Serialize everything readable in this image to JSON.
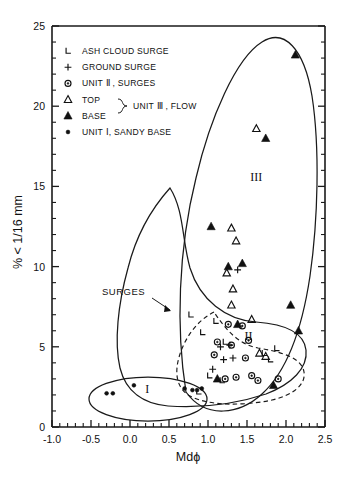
{
  "figure": {
    "background": "#ffffff",
    "ink": "#111111"
  },
  "chart_data": {
    "type": "scatter",
    "title": "",
    "xlabel": "Mdϕ",
    "ylabel": "% < 1/16 mm",
    "xlim": [
      -1.0,
      2.5
    ],
    "ylim": [
      0,
      25
    ],
    "xticks": [
      -1.0,
      -0.5,
      0.0,
      0.5,
      1.0,
      1.5,
      2.0,
      2.5
    ],
    "xticklabels": [
      "-1.0",
      "-0.5",
      "0.0",
      "0.5",
      "1.0",
      "1.5",
      "2.0",
      "2.5"
    ],
    "yticks": [
      0,
      5,
      10,
      15,
      20,
      25
    ],
    "yticklabels": [
      "0",
      "5",
      "10",
      "15",
      "20",
      "25"
    ],
    "x_minor_step": 0.1,
    "y_minor_step": 1,
    "grid": false,
    "legend_position": "upper-left-inside",
    "series": [
      {
        "name": "ASH CLOUD SURGE",
        "symbol": "ell-corner",
        "points": [
          [
            0.78,
            7.0
          ],
          [
            0.93,
            5.9
          ],
          [
            1.1,
            6.6
          ],
          [
            1.22,
            5.3
          ],
          [
            1.02,
            3.2
          ],
          [
            1.18,
            2.9
          ],
          [
            1.72,
            4.6
          ],
          [
            1.8,
            4.2
          ],
          [
            1.88,
            4.9
          ],
          [
            0.88,
            2.2
          ]
        ]
      },
      {
        "name": "GROUND SURGE",
        "symbol": "plus",
        "points": [
          [
            1.38,
            9.8
          ],
          [
            1.2,
            4.2
          ],
          [
            1.32,
            4.3
          ],
          [
            1.06,
            3.6
          ],
          [
            1.28,
            5.1
          ],
          [
            1.16,
            5.0
          ]
        ]
      },
      {
        "name": "UNIT II , SURGES",
        "symbol": "circle-dot",
        "points": [
          [
            1.12,
            5.3
          ],
          [
            1.3,
            5.1
          ],
          [
            1.44,
            6.3
          ],
          [
            1.52,
            5.4
          ],
          [
            1.36,
            3.1
          ],
          [
            1.22,
            3.0
          ],
          [
            1.56,
            3.2
          ],
          [
            1.64,
            2.9
          ],
          [
            1.9,
            3.0
          ],
          [
            1.48,
            4.3
          ],
          [
            1.26,
            6.4
          ],
          [
            1.08,
            4.5
          ]
        ]
      },
      {
        "name": "TOP — UNIT III , FLOW",
        "symbol": "triangle-open",
        "points": [
          [
            1.3,
            12.4
          ],
          [
            1.36,
            11.6
          ],
          [
            1.62,
            18.6
          ],
          [
            1.24,
            9.6
          ],
          [
            1.32,
            8.6
          ],
          [
            1.56,
            6.7
          ],
          [
            1.66,
            4.6
          ],
          [
            1.74,
            4.4
          ],
          [
            1.3,
            7.6
          ]
        ]
      },
      {
        "name": "BASE — UNIT III , FLOW",
        "symbol": "triangle-filled",
        "points": [
          [
            2.12,
            23.2
          ],
          [
            1.74,
            18.0
          ],
          [
            1.04,
            12.5
          ],
          [
            1.26,
            10.0
          ],
          [
            1.44,
            10.2
          ],
          [
            2.06,
            7.6
          ],
          [
            2.16,
            6.0
          ],
          [
            1.38,
            6.4
          ],
          [
            1.12,
            3.0
          ],
          [
            1.84,
            2.6
          ]
        ]
      },
      {
        "name": "UNIT I, SANDY BASE",
        "symbol": "dot",
        "points": [
          [
            -0.3,
            2.1
          ],
          [
            -0.22,
            2.1
          ],
          [
            0.05,
            2.6
          ],
          [
            0.7,
            2.4
          ],
          [
            0.86,
            2.3
          ],
          [
            0.92,
            2.4
          ],
          [
            0.8,
            2.3
          ]
        ]
      }
    ],
    "annotations": [
      {
        "text": "SURGES",
        "x": 0.43,
        "y": 8.2,
        "type": "leader-label"
      },
      {
        "text": "I",
        "x": 0.22,
        "y": 2.4,
        "type": "region-label"
      },
      {
        "text": "II",
        "x": 1.52,
        "y": 5.7,
        "type": "region-label"
      },
      {
        "text": "III",
        "x": 1.62,
        "y": 15.6,
        "type": "region-label"
      }
    ],
    "envelopes": [
      {
        "name": "surges-outer",
        "style": "solid"
      },
      {
        "name": "unit-ii-inner",
        "style": "dashed"
      },
      {
        "name": "unit-iii-outer",
        "style": "solid"
      },
      {
        "name": "unit-i-ellipse",
        "style": "solid"
      }
    ]
  },
  "legend": {
    "items": [
      {
        "symbol": "ell-corner",
        "label": "ASH CLOUD SURGE"
      },
      {
        "symbol": "plus",
        "label": "GROUND SURGE"
      },
      {
        "symbol": "circle-dot",
        "label": "UNIT Ⅱ , SURGES"
      },
      {
        "symbol": "triangle-open",
        "label": "TOP"
      },
      {
        "symbol": "triangle-filled",
        "label": "BASE"
      },
      {
        "symbol": "dot",
        "label": "UNIT Ⅰ, SANDY BASE"
      }
    ],
    "brace_label": "UNIT Ⅲ , FLOW"
  }
}
